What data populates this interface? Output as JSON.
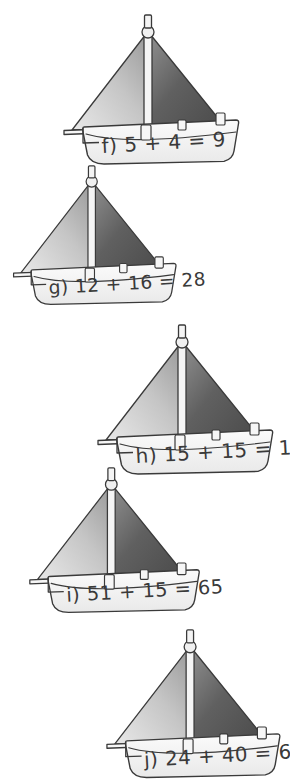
{
  "page": {
    "background_color": "#ffffff",
    "width": 290,
    "height": 782
  },
  "style": {
    "outline_color": "#3a3a3a",
    "hull_fill": "#f2f2f2",
    "sail_left_light": "#e8e8e8",
    "sail_left_dark": "#9b9b9b",
    "sail_right_light": "#8f8f8f",
    "sail_right_dark": "#4a4a4a",
    "mast_fill": "#f5f5f5",
    "text_color": "#3a3a3a"
  },
  "boats": [
    {
      "id": "boat-f",
      "label": "f)",
      "equation": "5 + 4 = 9",
      "full_text": "f) 5 + 4 = 9",
      "addend_1": 5,
      "addend_2": 4,
      "sum": 9,
      "position": {
        "left": 58,
        "top": 12
      },
      "scale": 1.0,
      "align": "right"
    },
    {
      "id": "boat-g",
      "label": "g)",
      "equation": "12 + 16 = 28",
      "full_text": "g) 12 + 16 = 28",
      "addend_1": 12,
      "addend_2": 16,
      "sum": 28,
      "position": {
        "left": 8,
        "top": 163
      },
      "scale": 0.93,
      "align": "left"
    },
    {
      "id": "boat-h",
      "label": "h)",
      "equation": "15 + 15 = 15",
      "full_text": "h) 15 + 15 = 15",
      "addend_1": 15,
      "addend_2": 15,
      "sum": 15,
      "position": {
        "left": 92,
        "top": 322
      },
      "scale": 1.0,
      "align": "right"
    },
    {
      "id": "boat-i",
      "label": "i)",
      "equation": "51 + 15 = 65",
      "full_text": "i) 51 + 15 = 65",
      "addend_1": 51,
      "addend_2": 15,
      "sum": 65,
      "position": {
        "left": 24,
        "top": 465
      },
      "scale": 0.97,
      "align": "left"
    },
    {
      "id": "boat-j",
      "label": "j)",
      "equation": "24 + 40 = 64",
      "full_text": "j) 24 + 40 = 64",
      "addend_1": 24,
      "addend_2": 40,
      "sum": 64,
      "position": {
        "left": 101,
        "top": 627
      },
      "scale": 0.99,
      "align": "right"
    }
  ]
}
